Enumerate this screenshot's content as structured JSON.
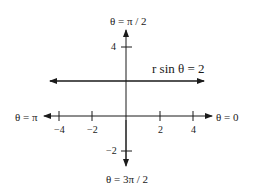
{
  "diagram": {
    "type": "polar-axes-with-line",
    "equation_label": "r sin θ = 2",
    "axis_labels": {
      "top": "θ = π / 2",
      "bottom": "θ = 3π / 2",
      "left": "θ = π",
      "right": "θ = 0"
    },
    "x_ticks": [
      "−4",
      "−2",
      "2",
      "4"
    ],
    "y_ticks": [
      "4",
      "−2"
    ],
    "line": {
      "description": "horizontal line y = 2",
      "y": 2
    },
    "colors": {
      "ink": "#1a1a1a",
      "background": "#ffffff"
    }
  }
}
